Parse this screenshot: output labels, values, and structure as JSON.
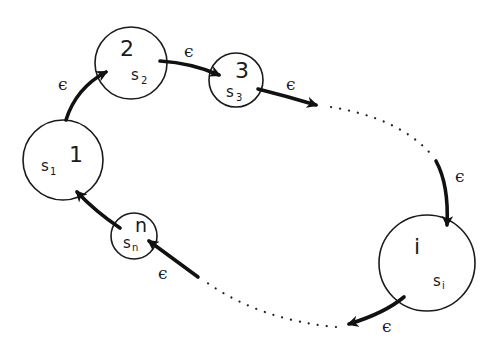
{
  "diagram": {
    "type": "cyclic state diagram",
    "nodes": [
      {
        "id": "1",
        "label": "1",
        "state": "s",
        "sub": "1"
      },
      {
        "id": "2",
        "label": "2",
        "state": "s",
        "sub": "2"
      },
      {
        "id": "3",
        "label": "3",
        "state": "s",
        "sub": "3"
      },
      {
        "id": "i",
        "label": "i",
        "state": "s",
        "sub": "i"
      },
      {
        "id": "n",
        "label": "n",
        "state": "s",
        "sub": "n"
      }
    ],
    "edge_label": "ϵ",
    "edges": [
      {
        "from": "1",
        "to": "2",
        "label": "ϵ"
      },
      {
        "from": "2",
        "to": "3",
        "label": "ϵ"
      },
      {
        "from": "3",
        "to": "...",
        "label": "ϵ"
      },
      {
        "from": "...",
        "to": "i",
        "label": "ϵ"
      },
      {
        "from": "i",
        "to": "...",
        "label": "ϵ"
      },
      {
        "from": "...",
        "to": "n",
        "label": "ϵ"
      },
      {
        "from": "n",
        "to": "1",
        "label": ""
      }
    ],
    "colors": {
      "stroke": "#1a1a1a",
      "background": "#ffffff"
    }
  }
}
